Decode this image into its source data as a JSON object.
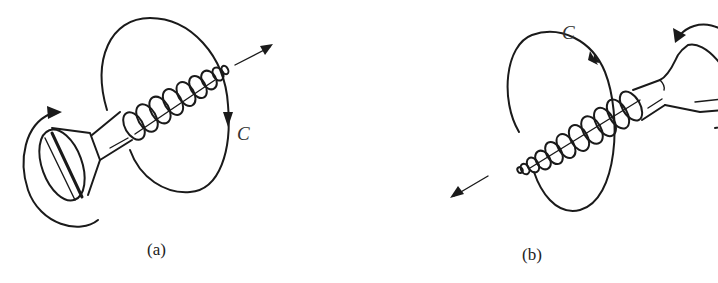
{
  "figure": {
    "panels": [
      {
        "id": "a",
        "caption": "(a)",
        "circulation_label": "C",
        "screw_orientation": "head lower-left, tip upper-right",
        "translation_arrow": "upper-right",
        "head_rotation": "counterclockwise as viewed",
        "loop_arrow_direction": "down on right side"
      },
      {
        "id": "b",
        "caption": "(b)",
        "circulation_label": "C",
        "screw_orientation": "head upper-right, tip lower-left",
        "translation_arrow": "lower-left",
        "head_rotation": "clockwise as viewed",
        "loop_arrow_direction": "up on right side"
      }
    ],
    "colors": {
      "line": "#1a1a1a",
      "background": "#ffffff"
    }
  }
}
